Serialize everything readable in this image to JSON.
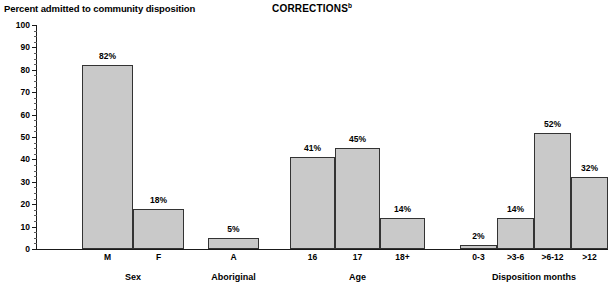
{
  "header": {
    "subtitle": "Percent admitted to community disposition",
    "title": "CORRECTIONS",
    "title_superscript": "b"
  },
  "chart_data": {
    "type": "bar",
    "title": "CORRECTIONS",
    "subtitle": "Percent admitted to community disposition",
    "ylabel": "Percent admitted to community disposition",
    "xlabel": "",
    "ylim": [
      0,
      100
    ],
    "ytick_step": 10,
    "yminor_step": 2.5,
    "grid": false,
    "legend": null,
    "bar_color": "#c9c9c9",
    "bar_border_color": "#333333",
    "ytick_labels": [
      "0",
      "10",
      "20",
      "30",
      "40",
      "50",
      "60",
      "70",
      "80",
      "90",
      "100"
    ],
    "ytick_values": [
      0,
      10,
      20,
      30,
      40,
      50,
      60,
      70,
      80,
      90,
      100
    ],
    "groups": [
      {
        "name": "Sex",
        "categories": [
          "M",
          "F"
        ],
        "values": [
          82,
          18
        ],
        "labels": [
          "82%",
          "18%"
        ]
      },
      {
        "name": "Aboriginal",
        "categories": [
          "A"
        ],
        "values": [
          5
        ],
        "labels": [
          "5%"
        ]
      },
      {
        "name": "Age",
        "categories": [
          "16",
          "17",
          "18+"
        ],
        "values": [
          41,
          45,
          14
        ],
        "labels": [
          "41%",
          "45%",
          "14%"
        ]
      },
      {
        "name": "Disposition months",
        "categories": [
          "0-3",
          ">3-6",
          ">6-12",
          ">12"
        ],
        "values": [
          2,
          14,
          52,
          32
        ],
        "labels": [
          "2%",
          "14%",
          "52%",
          "32%"
        ]
      }
    ]
  }
}
